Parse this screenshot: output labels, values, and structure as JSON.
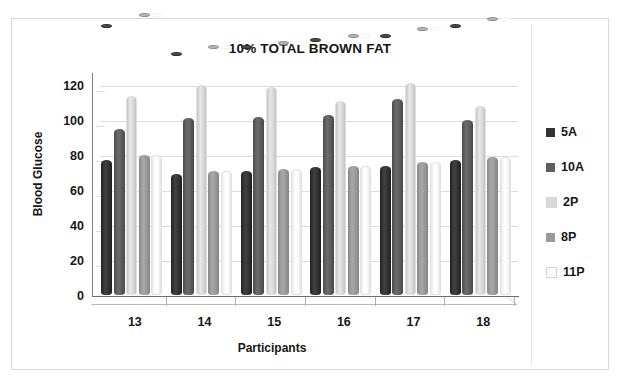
{
  "chart_data": {
    "type": "bar",
    "title": "10% TOTAL BROWN FAT",
    "xlabel": "Participants",
    "ylabel": "Blood Glucose",
    "categories": [
      "13",
      "14",
      "15",
      "16",
      "17",
      "18"
    ],
    "ylim": [
      0,
      120
    ],
    "yticks": [
      "0",
      "20",
      "40",
      "60",
      "80",
      "100",
      "120"
    ],
    "grid": true,
    "legend_position": "right",
    "series": [
      {
        "name": "5A",
        "color": "#333333",
        "values": [
          77,
          69,
          71,
          73,
          74,
          77
        ]
      },
      {
        "name": "10A",
        "color": "#5e5e5e",
        "values": [
          95,
          101,
          102,
          103,
          112,
          100
        ]
      },
      {
        "name": "2P",
        "color": "#d9d9d9",
        "values": [
          114,
          120,
          119,
          111,
          121,
          108
        ]
      },
      {
        "name": "8P",
        "color": "#9a9a9a",
        "values": [
          80,
          71,
          72,
          74,
          76,
          79
        ]
      },
      {
        "name": "11P",
        "color": "#fbfbfb",
        "values": [
          80,
          71,
          72,
          74,
          76,
          79
        ]
      }
    ]
  },
  "legend": {
    "items": [
      {
        "label": "5A",
        "color": "#333333"
      },
      {
        "label": "10A",
        "color": "#5e5e5e"
      },
      {
        "label": "2P",
        "color": "#d9d9d9"
      },
      {
        "label": "8P",
        "color": "#9a9a9a"
      },
      {
        "label": "11P",
        "color": "#fbfbfb"
      }
    ]
  }
}
